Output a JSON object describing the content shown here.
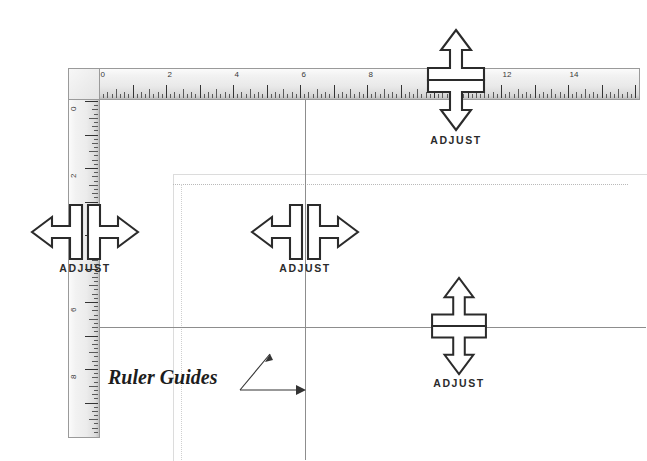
{
  "figure": {
    "kind": "ruler-guides-diagram",
    "background_color": "#ffffff",
    "line_color": "#333333",
    "guide_color": "#8d8d8d",
    "ruler_face_color": "#ececec",
    "ruler_border_color": "#9a9a9a"
  },
  "annotation": {
    "label": "Ruler Guides",
    "leader_arrow_up": "arrow-up-left-leader",
    "leader_arrow_right": "arrow-right-leader"
  },
  "horizontal_ruler": {
    "name": "horizontal-ruler",
    "unit": "inches",
    "origin_label": "0",
    "major_interval": 2,
    "minor_divisions": 8,
    "labels": [
      "0",
      "2",
      "4",
      "6",
      "8",
      "10",
      "12",
      "14",
      "16"
    ],
    "values": [
      0,
      2,
      4,
      6,
      8,
      10,
      12,
      14,
      16
    ]
  },
  "vertical_ruler": {
    "name": "vertical-ruler",
    "unit": "inches",
    "origin_label": "0",
    "major_interval": 2,
    "minor_divisions": 8,
    "labels": [
      "0",
      "2",
      "4",
      "6",
      "8",
      "10"
    ],
    "values": [
      0,
      2,
      4,
      6,
      8,
      10
    ]
  },
  "adjust_widgets": [
    {
      "id": "top-vertical-adjust",
      "label": "ADJUST",
      "orientation": "vertical",
      "arrow_glyph": "double-arrow-vertical",
      "position_on": "horizontal-ruler",
      "ruler_value": 11
    },
    {
      "id": "left-horizontal-adjust",
      "label": "ADJUST",
      "orientation": "horizontal",
      "arrow_glyph": "double-arrow-horizontal",
      "position_on": "vertical-ruler",
      "ruler_value": 4
    },
    {
      "id": "center-horizontal-adjust",
      "label": "ADJUST",
      "orientation": "horizontal",
      "arrow_glyph": "double-arrow-horizontal",
      "position_on": "vertical-guide",
      "ruler_value": 6
    },
    {
      "id": "bottom-vertical-adjust",
      "label": "ADJUST",
      "orientation": "vertical",
      "arrow_glyph": "double-arrow-vertical",
      "position_on": "horizontal-guide",
      "ruler_value": 7
    }
  ],
  "guides": [
    {
      "id": "vertical-ruler-guide",
      "orientation": "vertical",
      "ruler_value": 6
    },
    {
      "id": "horizontal-ruler-guide",
      "orientation": "horizontal",
      "ruler_value": 7
    }
  ],
  "margin_guides": {
    "id": "margin-box",
    "style": "dotted",
    "left_value": 2.3,
    "top_value": 2.5
  }
}
